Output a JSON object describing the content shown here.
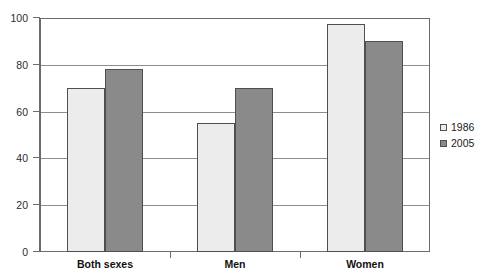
{
  "chart_data": {
    "type": "bar",
    "title": "",
    "xlabel": "",
    "ylabel": "",
    "categories": [
      "Both sexes",
      "Men",
      "Women"
    ],
    "series": [
      {
        "name": "1986",
        "color": "#ececec",
        "values": [
          70,
          55,
          97.5
        ]
      },
      {
        "name": "2005",
        "color": "#8a8a8a",
        "values": [
          78,
          70,
          90
        ]
      }
    ],
    "ylim": [
      0,
      100
    ],
    "yticks": [
      0,
      20,
      40,
      60,
      80,
      100
    ],
    "ytick_labels": [
      "0",
      "20",
      "40",
      "60",
      "80",
      "100"
    ],
    "grid": true,
    "grid_axis": "y",
    "legend_position": "right"
  },
  "legend": {
    "items": [
      {
        "label": "1986"
      },
      {
        "label": "2005"
      }
    ]
  },
  "axis": {
    "y_labels": [
      "100",
      "80",
      "60",
      "40",
      "20",
      "0"
    ],
    "x_labels": [
      "Both sexes",
      "Men",
      "Women"
    ]
  },
  "colors": {
    "series_a": "#ececec",
    "series_b": "#8a8a8a",
    "axis": "#6b6b6b",
    "grid": "#8d8d8d",
    "bar_border": "#4f4f4f"
  }
}
